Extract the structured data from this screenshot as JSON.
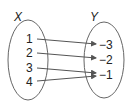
{
  "diagram": {
    "type": "mapping",
    "domain_label": "X",
    "range_label": "Y",
    "domain": [
      "1",
      "2",
      "3",
      "4"
    ],
    "range": [
      "−3",
      "−2",
      "−1"
    ],
    "mappings": [
      {
        "from": "1",
        "to": "−3"
      },
      {
        "from": "2",
        "to": "−2"
      },
      {
        "from": "3",
        "to": "−1"
      },
      {
        "from": "4",
        "to": "−1"
      }
    ],
    "colors": {
      "stroke": "#555555",
      "text": "#222222"
    }
  }
}
